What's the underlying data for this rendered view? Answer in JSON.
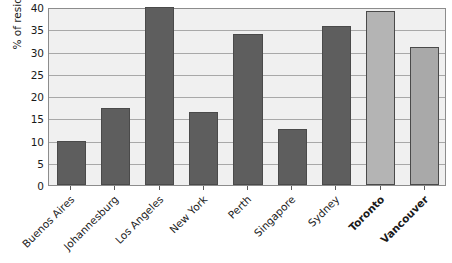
{
  "chart_data": {
    "type": "bar",
    "title": "",
    "xlabel": "",
    "ylabel": "% of residents",
    "ylim": [
      0,
      40
    ],
    "ytick_step": 5,
    "grid": true,
    "legend": "none",
    "yticks": [
      "0",
      "5",
      "10",
      "15",
      "20",
      "25",
      "30",
      "35",
      "40"
    ],
    "categories": [
      "Buenos Aires",
      "Johannesburg",
      "Los Angeles",
      "New York",
      "Perth",
      "Singapore",
      "Sydney",
      "Toronto",
      "Vancouver"
    ],
    "values": [
      10,
      17.3,
      40,
      16.4,
      34,
      12.5,
      35.7,
      39,
      31
    ],
    "highlighted_categories": [
      "Toronto",
      "Vancouver"
    ],
    "bar_colors": [
      "#5e5e5e",
      "#5e5e5e",
      "#5e5e5e",
      "#5e5e5e",
      "#5e5e5e",
      "#5e5e5e",
      "#5e5e5e",
      "#b4b4b4",
      "#a9a9a9"
    ]
  },
  "style": {
    "plot_background": "#f0f0f0",
    "gridline_color": "#a8a8a8",
    "frame_color": "#8c8c8c",
    "bar_edge_color": "#4a4a4a",
    "text_color": "#1a1a1a",
    "page_background": "#ffffff"
  }
}
